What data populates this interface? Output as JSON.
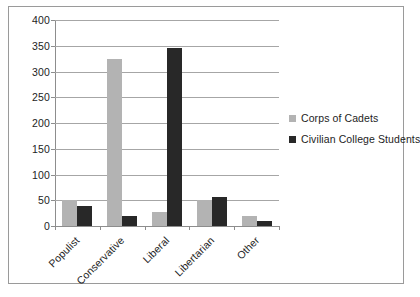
{
  "chart_data": {
    "type": "bar",
    "title": "",
    "subtitle": "",
    "xlabel": "",
    "ylabel": "",
    "categories": [
      "Populist",
      "Conservative",
      "Liberal",
      "Libertarian",
      "Other"
    ],
    "series": [
      {
        "name": "Corps of Cadets",
        "color": "#b3b3b3",
        "values": [
          50,
          325,
          28,
          50,
          20
        ]
      },
      {
        "name": "Civilian College Students",
        "color": "#282828",
        "values": [
          38,
          20,
          345,
          57,
          10
        ]
      }
    ],
    "ylim": [
      0,
      400
    ],
    "ytick_step": 50,
    "yticks": [
      0,
      50,
      100,
      150,
      200,
      250,
      300,
      350,
      400
    ],
    "ytick_labels": [
      "0",
      "50",
      "100",
      "150",
      "200",
      "250",
      "300",
      "350",
      "400"
    ],
    "grid": true,
    "grid_axis": "y",
    "legend": true,
    "legend_position": "right",
    "frame": true,
    "xtick_label_rotation": -45
  }
}
